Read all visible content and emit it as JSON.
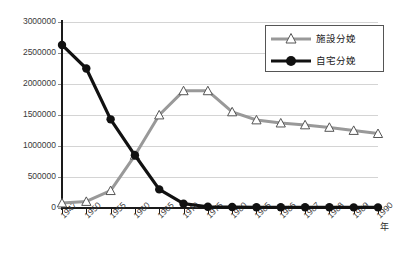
{
  "chart_data": {
    "type": "line",
    "title": "",
    "subtitle": "",
    "xlabel": "年",
    "ylabel": "",
    "grid": true,
    "legend_position": "top-right",
    "xlim_categories": true,
    "ylim": [
      0,
      3000000
    ],
    "ytick_values": [
      0,
      500000,
      1000000,
      1500000,
      2000000,
      2500000,
      3000000
    ],
    "ytick_labels": [
      "0",
      "500000",
      "1000000",
      "1500000",
      "2000000",
      "2500000",
      "3000000"
    ],
    "categories": [
      "1947",
      "1950",
      "1955",
      "1960",
      "1965",
      "1970",
      "1975",
      "1980",
      "1985",
      "1986",
      "1987",
      "1988",
      "1989",
      "1990"
    ],
    "series": [
      {
        "name": "施設分娩",
        "color": "#999999",
        "marker": "triangle-open",
        "values": [
          80000,
          105000,
          280000,
          850000,
          1500000,
          1890000,
          1890000,
          1550000,
          1420000,
          1370000,
          1340000,
          1300000,
          1250000,
          1200000
        ]
      },
      {
        "name": "自宅分娩",
        "color": "#111111",
        "marker": "circle-filled",
        "values": [
          2630000,
          2250000,
          1430000,
          850000,
          300000,
          70000,
          20000,
          15000,
          12000,
          12000,
          11000,
          11000,
          10000,
          10000
        ]
      }
    ]
  },
  "legend": {
    "items": [
      {
        "label": "施設分娩",
        "marker": "triangle-open-icon"
      },
      {
        "label": "自宅分娩",
        "marker": "circle-filled-icon"
      }
    ]
  },
  "axis": {
    "x_unit_label": "年"
  }
}
